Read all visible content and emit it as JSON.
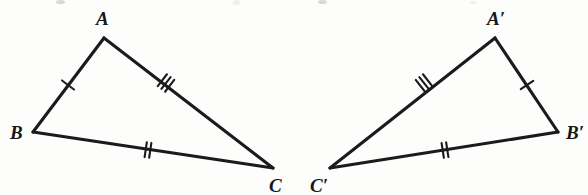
{
  "figure": {
    "background_color": "#fdfdfc",
    "stroke_color": "#1b1b1f",
    "width": 588,
    "height": 195
  },
  "triangles": [
    {
      "id": "triangle-abc",
      "name": "Triangle ABC",
      "orientation": "left",
      "vertices": [
        {
          "key": "A",
          "label": "A",
          "x": 104,
          "y": 38,
          "label_x": 96,
          "label_y": 25
        },
        {
          "key": "B",
          "label": "B",
          "x": 33,
          "y": 132,
          "label_x": 10,
          "label_y": 139
        },
        {
          "key": "C",
          "label": "C",
          "x": 273,
          "y": 168,
          "label_x": 269,
          "label_y": 192
        }
      ],
      "edges": [
        {
          "key": "AB",
          "from": "A",
          "to": "B",
          "ticks": 1,
          "tick_x": 68,
          "tick_y": 85
        },
        {
          "key": "AC",
          "from": "A",
          "to": "C",
          "ticks": 3,
          "tick_x": 166,
          "tick_y": 83
        },
        {
          "key": "BC",
          "from": "B",
          "to": "C",
          "ticks": 2,
          "tick_x": 148,
          "tick_y": 150
        }
      ]
    },
    {
      "id": "triangle-a-prime-b-prime-c-prime",
      "name": "Triangle A'B'C'",
      "orientation": "right",
      "vertices": [
        {
          "key": "A'",
          "label": "A′",
          "x": 495,
          "y": 38,
          "label_x": 487,
          "label_y": 25
        },
        {
          "key": "B'",
          "label": "B′",
          "x": 558,
          "y": 132,
          "label_x": 566,
          "label_y": 139
        },
        {
          "key": "C'",
          "label": "C′",
          "x": 330,
          "y": 168,
          "label_x": 310,
          "label_y": 192
        }
      ],
      "edges": [
        {
          "key": "A'B'",
          "from": "A'",
          "to": "B'",
          "ticks": 1,
          "tick_x": 527,
          "tick_y": 85
        },
        {
          "key": "A'C'",
          "from": "A'",
          "to": "C'",
          "ticks": 3,
          "tick_x": 424,
          "tick_y": 83
        },
        {
          "key": "B'C'",
          "from": "B'",
          "to": "C'",
          "ticks": 2,
          "tick_x": 445,
          "tick_y": 150
        }
      ]
    }
  ],
  "congruence": {
    "note": "Corresponding sides marked with matching tick counts",
    "pairs": [
      {
        "left": "AB",
        "right": "A'B'",
        "ticks": 1
      },
      {
        "left": "BC",
        "right": "B'C'",
        "ticks": 2
      },
      {
        "left": "AC",
        "right": "A'C'",
        "ticks": 3
      }
    ]
  },
  "artifacts": {
    "description": "Faint scan remnants of clipped text along the top edge",
    "marks": [
      {
        "x": 56,
        "y": 0,
        "w": 9,
        "h": 4
      },
      {
        "x": 233,
        "y": 0,
        "w": 7,
        "h": 5
      },
      {
        "x": 318,
        "y": 0,
        "w": 9,
        "h": 4
      },
      {
        "x": 470,
        "y": 1,
        "w": 6,
        "h": 3
      }
    ]
  }
}
